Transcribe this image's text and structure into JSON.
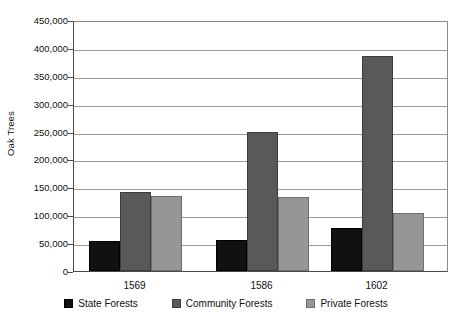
{
  "chart_data": {
    "type": "bar",
    "title": "",
    "xlabel": "",
    "ylabel": "Oak Trees",
    "categories": [
      "1569",
      "1586",
      "1602"
    ],
    "series": [
      {
        "name": "State Forests",
        "color": "#111111",
        "values": [
          53000,
          56000,
          77000
        ]
      },
      {
        "name": "Community Forests",
        "color": "#595959",
        "values": [
          141000,
          250000,
          385000
        ]
      },
      {
        "name": "Private Forests",
        "color": "#969696",
        "values": [
          135000,
          133000,
          104000
        ]
      }
    ],
    "ylim": [
      0,
      450000
    ],
    "ytick_step": 50000,
    "ytick_labels": [
      "0",
      "50,000",
      "100,000",
      "150,000",
      "200,000",
      "250,000",
      "300,000",
      "350,000",
      "400,000",
      "450,000"
    ],
    "ytick_values": [
      0,
      50000,
      100000,
      150000,
      200000,
      250000,
      300000,
      350000,
      400000,
      450000
    ],
    "grid": true,
    "legend_position": "bottom"
  }
}
